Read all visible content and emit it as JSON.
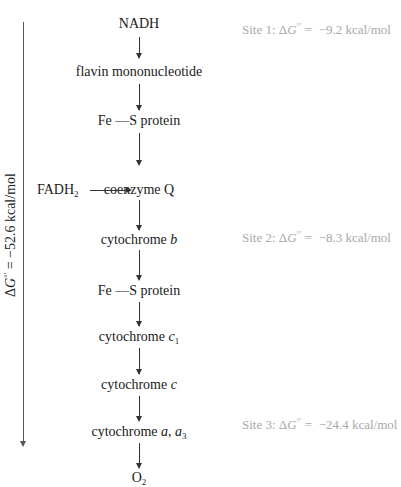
{
  "diagram": {
    "chain": [
      {
        "label": "NADH"
      },
      {
        "label": "flavin mononucleotide"
      },
      {
        "label": "Fe —S protein"
      },
      {
        "label": "coenzyme Q"
      },
      {
        "label": "cytochrome ",
        "italic": "b"
      },
      {
        "label": "Fe —S protein"
      },
      {
        "label": "cytochrome ",
        "italic": "c",
        "sub": "1"
      },
      {
        "label": "cytochrome ",
        "italic": "c"
      },
      {
        "label": "cytochrome ",
        "italic": "a",
        "sep": ", ",
        "italic2": "a",
        "sub2": "3"
      },
      {
        "label": "O",
        "sub": "2"
      }
    ],
    "side_input": {
      "label": "FADH",
      "sub": "2",
      "target": "coenzyme Q"
    },
    "sites": [
      {
        "prefix": "Site 1: Δ",
        "g": "G",
        "sup": "°′",
        "value": " =  −9.2 kcal/mol"
      },
      {
        "prefix": "Site 2: Δ",
        "g": "G",
        "sup": "°′",
        "value": " =  −8.3 kcal/mol"
      },
      {
        "prefix": "Site 3: Δ",
        "g": "G",
        "sup": "°′",
        "value": " =  −24.4 kcal/mol"
      }
    ],
    "total": {
      "prefix": "Δ",
      "g": "G",
      "sup": "°′",
      "value": " = −52.6 kcal/mol"
    },
    "colors": {
      "main_text": "#1a1a1a",
      "site_text": "#a8a8a8",
      "arrow": "#333333"
    }
  }
}
